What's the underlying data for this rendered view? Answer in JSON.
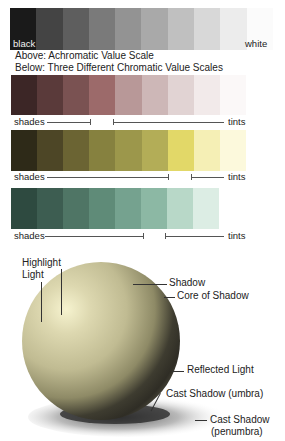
{
  "achromatic": {
    "swatches": [
      "#1a1a1a",
      "#444444",
      "#5e5e5e",
      "#7a7a7a",
      "#939393",
      "#a9a9a9",
      "#c0c0c0",
      "#d8d8d8",
      "#ececec",
      "#fbfbfb"
    ],
    "label_black": "black",
    "label_white": "white"
  },
  "captions": {
    "above": "Above:  Achromatic Value Scale",
    "below": "Below:  Three Different Chromatic Value Scales"
  },
  "chromatic_scales": [
    {
      "name": "red",
      "swatches": [
        "#3c2626",
        "#5a3a3a",
        "#7a5252",
        "#9c6a6a",
        "#b89898",
        "#cdb7b7",
        "#e1d3d3",
        "#f2eaea",
        "#fbf8f8"
      ],
      "shades_label": "shades",
      "tints_label": "tints"
    },
    {
      "name": "yellow",
      "swatches": [
        "#2e2a18",
        "#4d4626",
        "#6b6433",
        "#86813f",
        "#9c974b",
        "#b3ad57",
        "#e2d868",
        "#f5efb5",
        "#fcf9dc"
      ],
      "shades_label": "shades",
      "tints_label": "tints"
    },
    {
      "name": "green",
      "swatches": [
        "#2e4a40",
        "#3d5d51",
        "#4f7565",
        "#5f8b78",
        "#75a28f",
        "#8cb8a4",
        "#b8d8c8",
        "#dcede4"
      ],
      "shades_label": "shades",
      "tints_label": "tints"
    }
  ],
  "sphere": {
    "labels": {
      "highlight": "Highlight",
      "light": "Light",
      "shadow": "Shadow",
      "core_shadow": "Core of Shadow",
      "reflected_light": "Reflected Light",
      "cast_umbra": "Cast Shadow (umbra)",
      "cast_penumbra_1": "Cast Shadow",
      "cast_penumbra_2": "(penumbra)"
    },
    "colors": {
      "highlight": "#f6f3cf",
      "base": "#c9c49a",
      "mid": "#8e8a66",
      "core": "#2f2d25",
      "reflected": "#5e5b4a"
    }
  }
}
